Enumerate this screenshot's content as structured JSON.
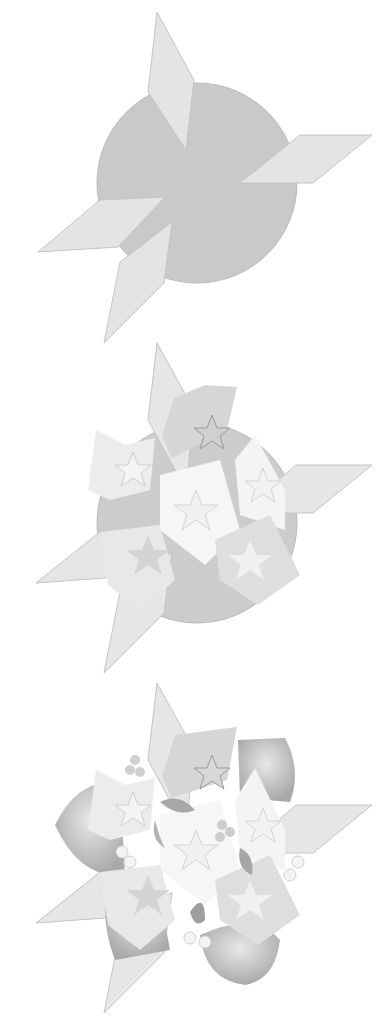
{
  "illustration": {
    "description": "Three-step construction of a decorative star and flower arrangement",
    "colors": {
      "background": "#ffffff",
      "circle": "#c9c9c9",
      "rhombus_fill": "#e3e3e3",
      "rhombus_stroke": "#bdbdbd",
      "star_flower_light": "#f2f2f2",
      "star_flower_mid": "#dcdcdc",
      "leaf_dark": "#a8a8a8",
      "leaf_mid": "#c2c2c2"
    },
    "steps": [
      {
        "index": 1,
        "name": "base",
        "elements": [
          "circle",
          "4 rhombus spikes"
        ]
      },
      {
        "index": 2,
        "name": "stars-added",
        "elements": [
          "circle",
          "4 rhombus spikes",
          "6 star-shaped flowers"
        ]
      },
      {
        "index": 3,
        "name": "finished",
        "elements": [
          "rhombus spikes",
          "4 rounded petals",
          "6 star-shaped flowers",
          "leaves",
          "small blossoms"
        ]
      }
    ]
  }
}
